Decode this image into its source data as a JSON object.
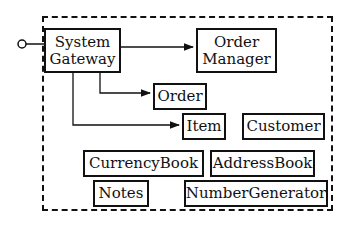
{
  "diagram": {
    "components": [
      {
        "id": "system-gateway",
        "label_lines": [
          "System",
          "Gateway"
        ]
      },
      {
        "id": "order-manager",
        "label_lines": [
          "Order",
          "Manager"
        ]
      },
      {
        "id": "order",
        "label": "Order"
      },
      {
        "id": "item",
        "label": "Item"
      },
      {
        "id": "customer",
        "label": "Customer"
      },
      {
        "id": "currency-book",
        "label": "CurrencyBook"
      },
      {
        "id": "address-book",
        "label": "AddressBook"
      },
      {
        "id": "notes",
        "label": "Notes"
      },
      {
        "id": "number-generator",
        "label": "NumberGenerator"
      }
    ],
    "connections": [
      {
        "from": "external-port",
        "to": "system-gateway",
        "type": "interface"
      },
      {
        "from": "system-gateway",
        "to": "order-manager",
        "type": "arrow"
      },
      {
        "from": "system-gateway",
        "to": "order",
        "type": "arrow"
      },
      {
        "from": "system-gateway",
        "to": "item",
        "type": "arrow"
      }
    ],
    "boundary": "dashed"
  }
}
